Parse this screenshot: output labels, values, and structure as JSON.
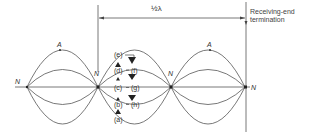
{
  "diagram": {
    "dimension_label": "½λ",
    "termination_label_line1": "Receiving-end",
    "termination_label_line2": "termination",
    "node_label": "N",
    "antinode_label": "A",
    "nodes": [
      {
        "label": "N",
        "x": 27
      },
      {
        "label": "N",
        "x": 98
      },
      {
        "label": "N",
        "x": 171
      },
      {
        "label": "N",
        "x": 245
      }
    ],
    "antinodes": [
      {
        "label": "A",
        "x": 60
      },
      {
        "label": "A",
        "x": 210
      }
    ],
    "phase_labels_left": [
      "(e)",
      "(d)",
      "(c)",
      "(b)",
      "(a)"
    ],
    "phase_labels_right": [
      "(f)",
      "(g)",
      "(h)"
    ],
    "colors": {
      "line": "#444444",
      "text": "#333333",
      "background": "#ffffff"
    }
  }
}
